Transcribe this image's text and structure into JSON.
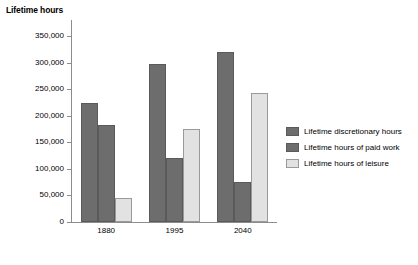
{
  "chart_data": {
    "type": "bar",
    "title": "",
    "xlabel": "",
    "ylabel": "Lifetime hours",
    "categories": [
      "1880",
      "1995",
      "2040"
    ],
    "series": [
      {
        "name": "Lifetime discretionary hours",
        "values": [
          223000,
          298000,
          319000
        ],
        "color": "#6d6d6d"
      },
      {
        "name": "Lifetime hours of paid work",
        "values": [
          183000,
          121000,
          75000
        ],
        "color": "#6d6d6d"
      },
      {
        "name": "Lifetime hours of leisure",
        "values": [
          45000,
          175000,
          243000
        ],
        "color": "#e2e2e2"
      }
    ],
    "ylim": [
      0,
      350000
    ],
    "ytick_labels": [
      "350,000",
      "300,000",
      "250,000",
      "200,000",
      "150,000",
      "100,000",
      "50,000",
      "0"
    ],
    "ytick_values": [
      350000,
      300000,
      250000,
      200000,
      150000,
      100000,
      50000,
      0
    ],
    "grid": false,
    "legend_position": "right"
  },
  "legend": {
    "items": [
      {
        "label": "Lifetime discretionary hours",
        "swatch": "dark"
      },
      {
        "label": "Lifetime hours of paid work",
        "swatch": "dark"
      },
      {
        "label": "Lifetime hours of leisure",
        "swatch": "light"
      }
    ]
  },
  "colors": {
    "bar_dark": "#6d6d6d",
    "bar_light": "#e2e2e2",
    "axis": "#8c8c8c",
    "background": "#ffffff",
    "text": "#000000"
  }
}
